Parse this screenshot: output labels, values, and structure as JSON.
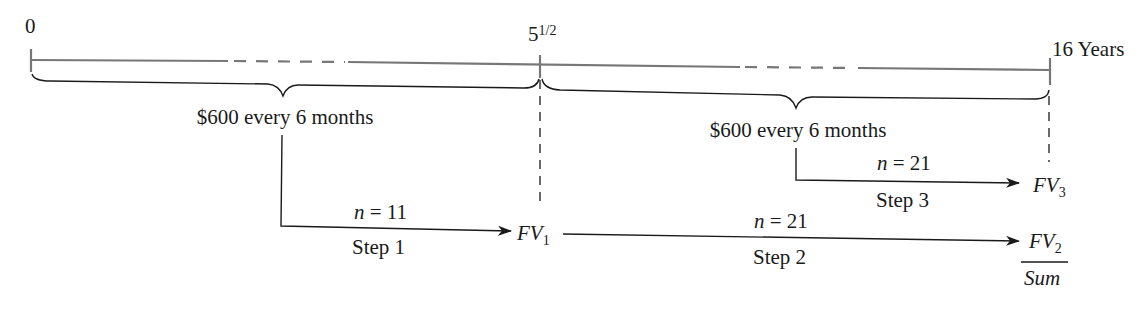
{
  "timeline": {
    "labels": {
      "start": "0",
      "middle": "5",
      "middle_fraction": "1/2",
      "end": "16 Years"
    },
    "periods": [
      {
        "label": "$600 every 6 months"
      },
      {
        "label": "$600 every 6 months"
      }
    ]
  },
  "steps": [
    {
      "n_var": "n",
      "n_eq": " = 11",
      "label": "Step 1",
      "target_main": "FV",
      "target_sub": "1"
    },
    {
      "n_var": "n",
      "n_eq": " = 21",
      "label": "Step 2",
      "target_main": "FV",
      "target_sub": "2"
    },
    {
      "n_var": "n",
      "n_eq": " = 21",
      "label": "Step 3",
      "target_main": "FV",
      "target_sub": "3"
    }
  ],
  "result": {
    "sum_label": "Sum"
  }
}
